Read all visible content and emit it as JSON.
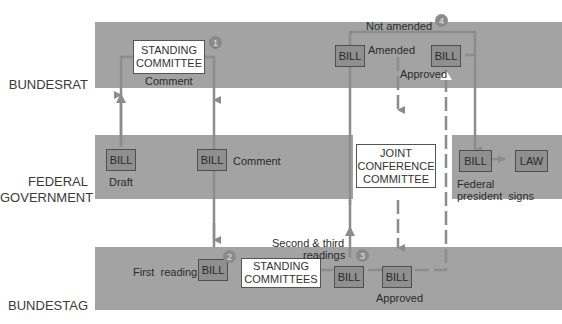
{
  "rows": {
    "bundesrat": "BUNDESRAT",
    "federal_government_line1": "FEDERAL",
    "federal_government_line2": "GOVERNMENT",
    "bundestag": "BUNDESTAG"
  },
  "bundesrat": {
    "standing_committee_line1": "STANDING",
    "standing_committee_line2": "COMMITTEE",
    "comment": "Comment",
    "bill_amended": "BILL",
    "amended": "Amended",
    "not_amended": "Not amended",
    "bill_approved": "BILL",
    "approved": "Approved"
  },
  "government": {
    "bill_draft": "BILL",
    "draft": "Draft",
    "bill_comment": "BILL",
    "comment": "Comment",
    "joint_line1": "JOINT",
    "joint_line2": "CONFERENCE",
    "joint_line3": "COMMITTEE",
    "bill_president": "BILL",
    "law": "LAW",
    "federal": "Federal",
    "president_signs": "president  signs"
  },
  "bundestag": {
    "first_reading": "First  reading",
    "bill_first": "BILL",
    "standing_committees_line1": "STANDING",
    "standing_committees_line2": "COMMITTEES",
    "second_third_line1": "Second & third",
    "second_third_line2": "readings",
    "bill_readings": "BILL",
    "bill_approved": "BILL",
    "approved": "Approved"
  },
  "steps": [
    "1",
    "2",
    "3",
    "4"
  ],
  "colors": {
    "band": "#a3a3a3",
    "bill_fill": "#8f8f8f",
    "arrow": "#8c8c8c"
  }
}
